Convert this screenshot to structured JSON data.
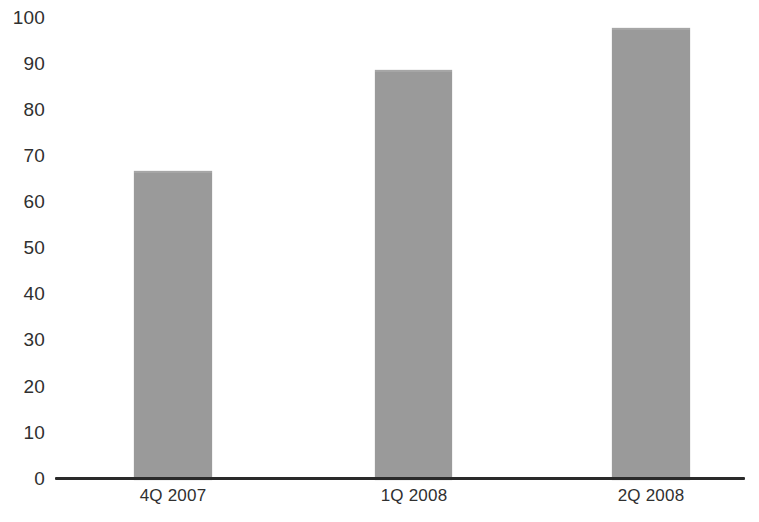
{
  "chart_data": {
    "type": "bar",
    "title": "",
    "subtitle": "",
    "xlabel": "",
    "ylabel": "",
    "categories": [
      "4Q 2007",
      "1Q 2008",
      "2Q 2008"
    ],
    "values": [
      67,
      89,
      98
    ],
    "series": [
      {
        "name": "",
        "values": [
          67,
          89,
          98
        ]
      }
    ],
    "ylim": [
      0,
      100
    ],
    "ytick_step": 10,
    "ytick_labels": [
      "0",
      "10",
      "20",
      "30",
      "40",
      "50",
      "60",
      "70",
      "80",
      "90",
      "100"
    ],
    "ytick_values": [
      0,
      10,
      20,
      30,
      40,
      50,
      60,
      70,
      80,
      90,
      100
    ],
    "grid": false,
    "legend": false,
    "legend_position": "none",
    "annotations": [],
    "data_labels": false,
    "bar_color": "#9a9a9a",
    "axis_color": "#2a2a2a",
    "background_color": "#ffffff",
    "text_color": "#303030"
  }
}
